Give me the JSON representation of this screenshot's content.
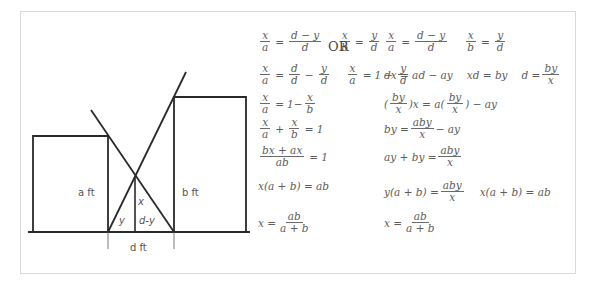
{
  "diagram": {
    "labels": {
      "left_height": "a ft",
      "right_height": "b ft",
      "crossing_height": "x",
      "left_segment": "y",
      "right_segment": "d-y",
      "distance": "d ft"
    }
  },
  "derivation_left": {
    "rows": [
      {
        "id": "r1",
        "parts": [
          {
            "frac": [
              "x",
              "a"
            ]
          },
          {
            "op": "="
          },
          {
            "frac": [
              "d − y",
              "d"
            ]
          },
          {
            "gap": true
          },
          {
            "frac": [
              "x",
              "b"
            ]
          },
          {
            "op": "="
          },
          {
            "frac": [
              "y",
              "d"
            ]
          }
        ]
      },
      {
        "id": "r2",
        "parts": [
          {
            "frac": [
              "x",
              "a"
            ]
          },
          {
            "op": "="
          },
          {
            "frac": [
              "d",
              "d"
            ]
          },
          {
            "op": "−"
          },
          {
            "frac": [
              "y",
              "d"
            ]
          },
          {
            "gap": true
          },
          {
            "frac": [
              "x",
              "a"
            ]
          },
          {
            "op": "="
          },
          {
            "text": "1"
          },
          {
            "op": "−"
          },
          {
            "frac": [
              "y",
              "d"
            ]
          }
        ]
      },
      {
        "id": "r3",
        "parts": [
          {
            "frac": [
              "x",
              "a"
            ]
          },
          {
            "op": "="
          },
          {
            "text": "1−"
          },
          {
            "frac": [
              "x",
              "b"
            ]
          }
        ]
      },
      {
        "id": "r4",
        "parts": [
          {
            "frac": [
              "x",
              "a"
            ]
          },
          {
            "op": "+"
          },
          {
            "frac": [
              "x",
              "b"
            ]
          },
          {
            "op": "="
          },
          {
            "text": "1"
          }
        ]
      },
      {
        "id": "r5",
        "parts": [
          {
            "frac": [
              "bx + ax",
              "ab"
            ]
          },
          {
            "op": "="
          },
          {
            "text": "1"
          }
        ]
      },
      {
        "id": "r6",
        "parts": [
          {
            "text": "x(a + b) = ab"
          }
        ]
      },
      {
        "id": "r7",
        "parts": [
          {
            "text": "x ="
          },
          {
            "frac": [
              "ab",
              "a + b"
            ]
          }
        ]
      }
    ]
  },
  "separator": "OR",
  "derivation_right": {
    "rows": [
      {
        "id": "s1",
        "parts": [
          {
            "frac": [
              "x",
              "a"
            ]
          },
          {
            "op": "="
          },
          {
            "frac": [
              "d − y",
              "d"
            ]
          },
          {
            "gap": true
          },
          {
            "frac": [
              "x",
              "b"
            ]
          },
          {
            "op": "="
          },
          {
            "frac": [
              "y",
              "d"
            ]
          }
        ]
      },
      {
        "id": "s2",
        "parts": [
          {
            "text": "dx = ad − ay"
          },
          {
            "gap": true
          },
          {
            "text": "xd = by"
          },
          {
            "gap": true
          },
          {
            "text": "d ="
          },
          {
            "frac": [
              "by",
              "x"
            ]
          }
        ]
      },
      {
        "id": "s3",
        "parts": [
          {
            "text": "("
          },
          {
            "frac": [
              "by",
              "x"
            ]
          },
          {
            "text": ")x = a("
          },
          {
            "frac": [
              "by",
              "x"
            ]
          },
          {
            "text": ") − ay"
          }
        ]
      },
      {
        "id": "s4",
        "parts": [
          {
            "text": "by ="
          },
          {
            "frac": [
              "aby",
              "x"
            ]
          },
          {
            "text": "− ay"
          }
        ]
      },
      {
        "id": "s5",
        "parts": [
          {
            "text": "ay + by ="
          },
          {
            "frac": [
              "aby",
              "x"
            ]
          }
        ]
      },
      {
        "id": "s6",
        "parts": [
          {
            "text": "y(a + b) ="
          },
          {
            "frac": [
              "aby",
              "x"
            ]
          },
          {
            "gap": true
          },
          {
            "text": "x(a + b) = ab"
          }
        ]
      },
      {
        "id": "s7",
        "parts": [
          {
            "text": "x ="
          },
          {
            "frac": [
              "ab",
              "a + b"
            ]
          }
        ]
      }
    ]
  }
}
